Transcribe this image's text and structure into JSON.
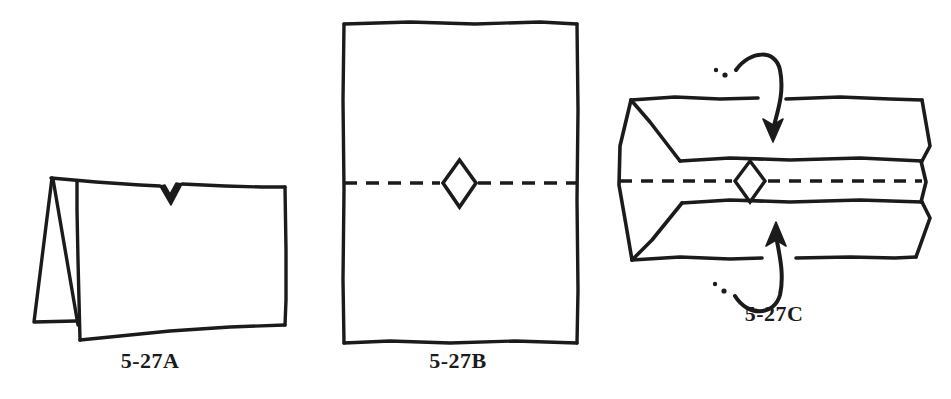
{
  "page": {
    "background_color": "#ffffff",
    "ink_color": "#1b1b1b",
    "width": 951,
    "height": 399
  },
  "figures": [
    {
      "id": "5-27A",
      "caption": "5-27A",
      "description": "Folded card standing tent-style, viewed from the front, with a small V notch cut in the top edge",
      "elements": {
        "notch": "v-notch",
        "fold": "left-spine-fold",
        "panels": 2
      }
    },
    {
      "id": "5-27B",
      "caption": "5-27B",
      "description": "Flat rectangular sheet with a horizontal dashed fold line through the middle and a small diamond aperture at the centre",
      "elements": {
        "fold_line": "horizontal-dashed",
        "aperture": "diamond",
        "panels": 2
      }
    },
    {
      "id": "5-27C",
      "caption": "5-27C",
      "description": "Open sheet seen in perspective with the top and bottom panels folding inward toward the dashed centre line; curved motion arrows show the folding direction",
      "elements": {
        "fold_line": "horizontal-dashed",
        "aperture": "diamond",
        "arrows": [
          {
            "name": "top-fold-arrow",
            "direction": "down"
          },
          {
            "name": "bottom-fold-arrow",
            "direction": "up"
          }
        ]
      }
    }
  ],
  "captions": {
    "a": "5-27A",
    "b": "5-27B",
    "c": "5-27C"
  }
}
